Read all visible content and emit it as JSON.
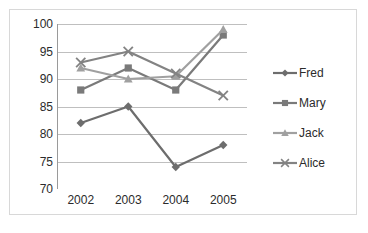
{
  "chart_data": {
    "type": "line",
    "title": "",
    "xlabel": "",
    "ylabel": "",
    "categories": [
      "2002",
      "2003",
      "2004",
      "2005"
    ],
    "ylim": [
      70,
      100
    ],
    "yticks": [
      70,
      75,
      80,
      85,
      90,
      95,
      100
    ],
    "ytick_labels": [
      "70",
      "75",
      "80",
      "85",
      "90",
      "95",
      "100"
    ],
    "grid": true,
    "grid_axis": "y",
    "legend_position": "right",
    "series": [
      {
        "name": "Fred",
        "marker": "diamond",
        "color": "#6d6d6d",
        "values": [
          82,
          85,
          74,
          78
        ]
      },
      {
        "name": "Mary",
        "marker": "square",
        "color": "#7a7a7a",
        "values": [
          88,
          92,
          88,
          98
        ]
      },
      {
        "name": "Jack",
        "marker": "triangle",
        "color": "#a0a0a0",
        "values": [
          92,
          90,
          90.5,
          99
        ]
      },
      {
        "name": "Alice",
        "marker": "cross",
        "color": "#838383",
        "values": [
          93,
          95,
          91,
          87
        ]
      }
    ]
  },
  "colors": {
    "background": "#ffffff",
    "border": "#d8d8d8",
    "axis": "#9a9a9a",
    "gridline": "#bfbfbf",
    "text": "#2b2b2b"
  }
}
